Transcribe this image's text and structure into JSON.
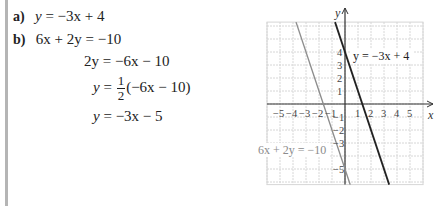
{
  "solution": {
    "part_a": {
      "label": "a)",
      "lhs": "y",
      "eq": "=",
      "rhs": "−3x + 4"
    },
    "part_b": {
      "label": "b)",
      "steps": [
        {
          "lhs": "6x + 2y",
          "eq": "=",
          "rhs": "−10"
        },
        {
          "lhs": "2y",
          "eq": "=",
          "rhs": "−6x − 10"
        },
        {
          "lhs": "y",
          "eq": "=",
          "frac_num": "1",
          "frac_den": "2",
          "rhs": "(−6x − 10)"
        },
        {
          "lhs": "y",
          "eq": "=",
          "rhs": "−3x − 5"
        }
      ]
    }
  },
  "chart_data": {
    "type": "line",
    "title": "",
    "xlabel": "x",
    "ylabel": "y",
    "xlim": [
      -6,
      6
    ],
    "ylim": [
      -6.2,
      6.3
    ],
    "grid": true,
    "x_ticks": [
      "−5",
      "−4",
      "−3",
      "−2",
      "−1",
      "1",
      "2",
      "3",
      "4",
      "5"
    ],
    "y_ticks": [
      "4",
      "3",
      "2",
      "1",
      "−1",
      "−2",
      "−3",
      "−5"
    ],
    "series": [
      {
        "name": "y = −3x + 4",
        "slope": -3,
        "intercept": 4,
        "color": "#222222"
      },
      {
        "name": "6x + 2y = −10",
        "slope": -3,
        "intercept": -5,
        "color": "#8c8c8c"
      }
    ],
    "annotations": [
      {
        "text": "y = −3x + 4",
        "near_series": 0
      },
      {
        "text": "6x + 2y = −10",
        "near_series": 1
      }
    ]
  },
  "colors": {
    "grid": "#d6d6d6",
    "axis": "#333333",
    "line1": "#222222",
    "line2": "#8c8c8c",
    "left_bar": "#b5b5b5"
  }
}
